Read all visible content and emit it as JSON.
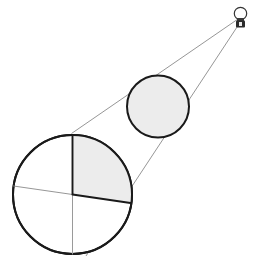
{
  "figure": {
    "background_color": "#ffffff",
    "width": 262,
    "height": 268
  },
  "palette": {
    "ray_stroke": "#8a8a8a",
    "outline_dark": "#1a1a1a",
    "outline_medium": "#555555",
    "fill_light_gray": "#ececec",
    "fill_white": "#ffffff",
    "bulb_base_fill": "#2b2b2b"
  },
  "light_source": {
    "label": "light-bulb",
    "glass": {
      "cx": 240.5,
      "cy": 13.5,
      "r": 6.2,
      "stroke": "#333333",
      "stroke_width": 1.2,
      "fill": "#ffffff"
    },
    "neck": {
      "x": 237.0,
      "y": 18.0,
      "width": 7.0,
      "height": 3.0,
      "fill": "#3a3a3a"
    },
    "base": {
      "x": 236.0,
      "y": 20.5,
      "width": 9.0,
      "height": 7.0,
      "fill": "#2b2b2b"
    },
    "base_highlight": {
      "x": 239.0,
      "y": 22.0,
      "width": 3.0,
      "height": 4.0,
      "fill": "#e8e8e8"
    }
  },
  "rays": [
    {
      "name": "upper-ray",
      "x1": 238.0,
      "y1": 19.0,
      "x2": 71.5,
      "y2": 133.5,
      "stroke": "#8a8a8a",
      "stroke_width": 0.9
    },
    {
      "name": "lower-ray",
      "x1": 241.0,
      "y1": 21.0,
      "x2": 86.0,
      "y2": 256.0,
      "stroke": "#8a8a8a",
      "stroke_width": 0.9
    }
  ],
  "small_circle": {
    "name": "small-circle",
    "cx": 158.0,
    "cy": 106.5,
    "r": 31.0,
    "fill": "#ececec",
    "stroke": "#1a1a1a",
    "stroke_width": 2.0
  },
  "large_circle": {
    "name": "large-circle",
    "cx": 72.5,
    "cy": 194.5,
    "r": 59.5,
    "fill": "#ffffff",
    "stroke": "#1a1a1a",
    "stroke_width": 2.0
  },
  "shaded_quadrant": {
    "name": "upper-right-quadrant",
    "fill": "#ececec",
    "description": "Region bounded by vertical radius up, arc to the right, and the tilted chord"
  },
  "chords": [
    {
      "name": "vertical-diameter-upper",
      "x1": 72.5,
      "y1": 135.0,
      "x2": 72.5,
      "y2": 194.5,
      "stroke": "#1a1a1a",
      "stroke_width": 1.9
    },
    {
      "name": "vertical-diameter-lower",
      "x1": 72.5,
      "y1": 194.5,
      "x2": 72.5,
      "y2": 254.0,
      "stroke": "#9a9a9a",
      "stroke_width": 1.0
    },
    {
      "name": "horizontal-chord-left",
      "x1": 13.5,
      "y1": 186.0,
      "x2": 72.5,
      "y2": 194.5,
      "stroke": "#8a8a8a",
      "stroke_width": 0.9
    },
    {
      "name": "horizontal-chord-right",
      "x1": 72.5,
      "y1": 194.5,
      "x2": 130.5,
      "y2": 203.0,
      "stroke": "#1a1a1a",
      "stroke_width": 1.9
    }
  ],
  "labels": {
    "none_visible": ""
  }
}
